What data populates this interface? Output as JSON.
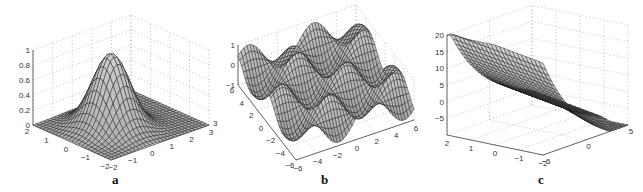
{
  "chart_data": [
    {
      "type": "surface3d",
      "caption": "a",
      "title": "",
      "function": "exp(-(x^2+y^2))",
      "xlim": [
        -2,
        3
      ],
      "ylim": [
        -2,
        2
      ],
      "zlim": [
        0,
        1
      ],
      "x_ticks": [
        "-2",
        "-1",
        "0",
        "1",
        "2",
        "3"
      ],
      "y_ticks": [
        "-2",
        "-1",
        "0",
        "1",
        "2"
      ],
      "z_ticks": [
        "0",
        "0.2",
        "0.4",
        "0.6",
        "0.8",
        "1"
      ],
      "peak": {
        "x": 0,
        "y": 0,
        "z": 1
      },
      "grid": true
    },
    {
      "type": "surface3d",
      "caption": "b",
      "title": "",
      "function": "sin(x)*cos(y)",
      "xlim": [
        -6,
        6
      ],
      "ylim": [
        -6,
        6
      ],
      "zlim": [
        -1,
        1
      ],
      "x_ticks": [
        "-6",
        "-4",
        "-2",
        "0",
        "2",
        "4",
        "6"
      ],
      "y_ticks": [
        "-6",
        "-4",
        "-2",
        "0",
        "2",
        "4",
        "6"
      ],
      "z_ticks": [
        "-1",
        "0",
        "1"
      ],
      "grid": true
    },
    {
      "type": "surface3d",
      "caption": "c",
      "title": "",
      "function": "cubic saddle-like surface",
      "xlim": [
        -5,
        5
      ],
      "ylim": [
        -2,
        2
      ],
      "zlim": [
        -10,
        20
      ],
      "x_ticks": [
        "-5",
        "0",
        "5"
      ],
      "y_ticks": [
        "-2",
        "-1",
        "0",
        "1",
        "2"
      ],
      "z_ticks": [
        "-5",
        "0",
        "5",
        "10",
        "15",
        "20"
      ],
      "grid": true
    }
  ],
  "panels": {
    "a": {
      "caption": "a",
      "stray_tick": ""
    },
    "b": {
      "caption": "b",
      "stray_tick": "3"
    },
    "c": {
      "caption": "c"
    }
  }
}
